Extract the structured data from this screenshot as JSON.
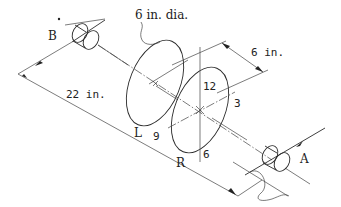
{
  "diagram": {
    "type": "isometric engineering drawing — rotor with two balancing disks on shaft between bearings",
    "labels": {
      "bearing_left": "B",
      "bearing_right": "A",
      "disk_left": "L",
      "disk_right": "R",
      "disk_diameter": "6 in. dia.",
      "disk_spacing": "6 in.",
      "shaft_length": "22 in."
    },
    "clock_positions": {
      "top": "12",
      "right": "3",
      "bottom": "6",
      "left": "9"
    },
    "colors": {
      "line": "#2a2a2a",
      "background": "#ffffff"
    }
  }
}
